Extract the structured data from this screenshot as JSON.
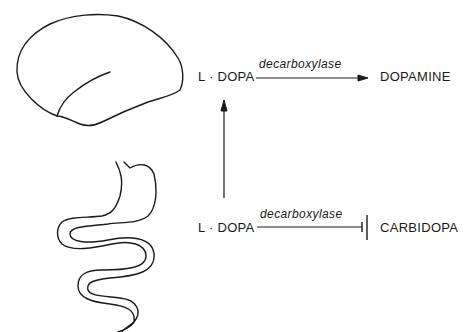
{
  "diagram": {
    "organs": {
      "brain": {
        "icon": "brain-icon"
      },
      "gut": {
        "icon": "stomach-intestine-icon"
      }
    },
    "top_pathway": {
      "substrate": "L · DOPA",
      "enzyme": "decarboxylase",
      "product": "DOPAMINE",
      "arrow": "conversion-arrow"
    },
    "bottom_pathway": {
      "substrate": "L · DOPA",
      "enzyme": "decarboxylase",
      "inhibitor": "CARBIDOPA",
      "arrow": "inhibition-bar"
    },
    "transport_arrow": "upward-arrow",
    "stroke_color": "#1a1a1a"
  }
}
